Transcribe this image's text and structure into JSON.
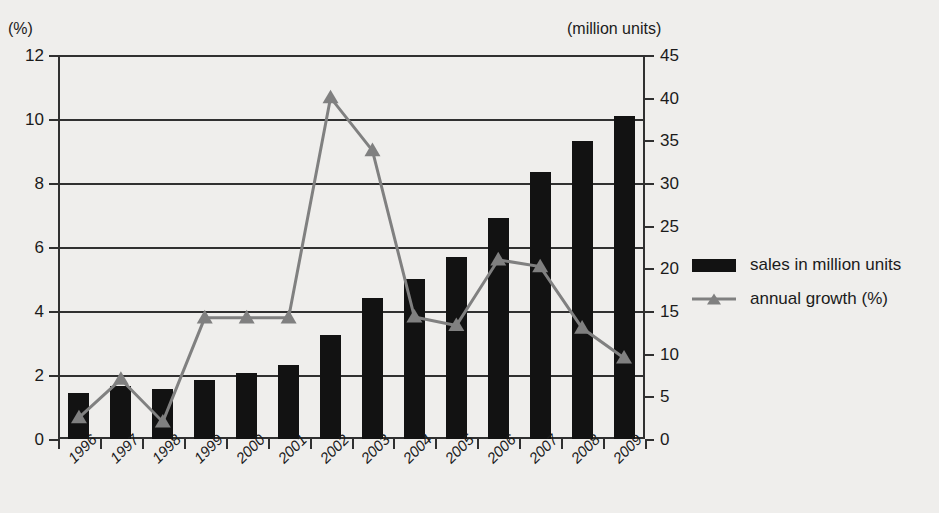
{
  "chart_data": {
    "type": "bar",
    "title": "",
    "categories": [
      "1996",
      "1997",
      "1998",
      "1999",
      "2000",
      "2001",
      "2002",
      "2003",
      "2004",
      "2005",
      "2006",
      "2007",
      "2008",
      "2009"
    ],
    "series": [
      {
        "name": "sales in million units",
        "type": "bar",
        "axis": "left",
        "color": "#121212",
        "values": [
          1.45,
          1.65,
          1.55,
          1.85,
          2.05,
          2.3,
          3.25,
          4.4,
          5.0,
          5.7,
          6.9,
          8.35,
          9.3,
          10.1
        ]
      },
      {
        "name": "annual growth (%)",
        "type": "line",
        "axis": "right",
        "color": "#808080",
        "values": [
          2.5,
          7.0,
          2.0,
          14.2,
          14.2,
          14.2,
          40.0,
          33.8,
          14.3,
          13.3,
          21.0,
          20.2,
          13.0,
          9.5
        ]
      }
    ],
    "left_axis": {
      "unit_label": "(%)",
      "ticks": [
        "0",
        "2",
        "4",
        "6",
        "8",
        "10",
        "12"
      ],
      "min": 0,
      "max": 12,
      "step": 2
    },
    "right_axis": {
      "unit_label": "(million units)",
      "ticks": [
        "0",
        "5",
        "10",
        "15",
        "20",
        "25",
        "30",
        "35",
        "40",
        "45"
      ],
      "min": 0,
      "max": 45,
      "step": 5
    },
    "xlabel": "",
    "ylabel": "",
    "grid": true,
    "legend_position": "right"
  },
  "legend": {
    "items": [
      {
        "label": "sales in million units",
        "marker": "bar-swatch-icon"
      },
      {
        "label": "annual growth (%)",
        "marker": "line-triangle-icon"
      }
    ]
  }
}
